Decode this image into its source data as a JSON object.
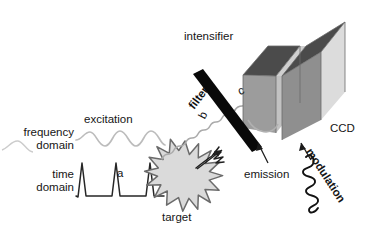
{
  "figure": {
    "kind": "schematic-diagram",
    "background": "#ffffff"
  },
  "labels": {
    "frequency_domain": "frequency\ndomain",
    "time_domain": "time\ndomain",
    "excitation": "excitation",
    "a": "a",
    "b": "b",
    "c": "c",
    "target": "target",
    "filter": "filter",
    "intensifier": "intensifier",
    "ccd": "CCD",
    "emission": "emission",
    "modulation": "modulation"
  },
  "colors": {
    "text": "#161616",
    "sine_wave": "#b9b9b9",
    "pulse_wave": "#2a2a2a",
    "emitted_wave": "#a8a8a8",
    "starburst_fill": "#d9d9d9",
    "starburst_stroke": "#6e6e6e",
    "filter_bar": "#0a0a0a",
    "block_top_face": "#4f4f4f",
    "block_front_face": "#9a9a9a",
    "block_right_face": "#d8d8d8",
    "block_gap_face": "#c4c4c4",
    "arrow": "#1b1b1b",
    "modulation_wave": "#141414"
  },
  "elements": {
    "excitation_sine": {
      "name": "excitation-sine-wave",
      "cycles": 3,
      "style": "light-gray smooth sinusoid"
    },
    "time_pulses": {
      "name": "time-domain-pulse-train",
      "pulse_count": 3,
      "style": "dark narrow spikes on baseline"
    },
    "starburst": {
      "name": "target-starburst",
      "spikes": 20,
      "style": "gray filled star"
    },
    "emitted_sine": {
      "name": "emitted-wave-b",
      "style": "gray low-amplitude sinusoid rising to filter"
    },
    "emitted_pulse": {
      "name": "emitted-pulse-a",
      "style": "dark decaying pulse leaving target"
    },
    "filter_bar": {
      "name": "optical-filter-bar",
      "angle_deg": -53
    },
    "intensifier_block": {
      "name": "intensifier-block",
      "shape": "isometric-box"
    },
    "ccd_block": {
      "name": "ccd-block",
      "shape": "isometric-box"
    },
    "emission_arrows": {
      "name": "emission-arrows",
      "count": 2,
      "direction": "up-right"
    },
    "modulation_wave": {
      "name": "modulation-wave",
      "style": "dark diagonal squiggle",
      "angle_deg": 57
    }
  }
}
